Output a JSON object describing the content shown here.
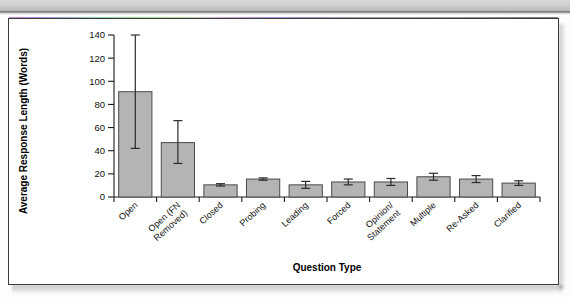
{
  "figure": {
    "panel_background": "#ffffff",
    "panel_border_color": "#3a3a3a",
    "bar_fill_color": "#b4b4b4",
    "bar_edge_color": "#4a4a4a",
    "error_bar_color": "#2b2b2b"
  },
  "chart_data": {
    "type": "bar",
    "title": "",
    "xlabel": "Question Type",
    "ylabel": "Average Response Length (Words)",
    "ylim": [
      0,
      140
    ],
    "yticks": [
      0,
      20,
      40,
      60,
      80,
      100,
      120,
      140
    ],
    "grid": false,
    "legend": null,
    "categories": [
      "Open",
      "Open (FN Removed)",
      "Closed",
      "Probing",
      "Leading",
      "Forced",
      "Opinion/ Statement",
      "Multiple",
      "Re-Asked",
      "Clarified"
    ],
    "category_lines": [
      [
        "Open"
      ],
      [
        "Open (FN",
        "Removed)"
      ],
      [
        "Closed"
      ],
      [
        "Probing"
      ],
      [
        "Leading"
      ],
      [
        "Forced"
      ],
      [
        "Opinion/",
        "Statement"
      ],
      [
        "Multiple"
      ],
      [
        "Re-Asked"
      ],
      [
        "Clarified"
      ]
    ],
    "values": [
      91,
      47,
      10.5,
      15.5,
      10.5,
      13,
      13,
      17.5,
      15.5,
      12
    ],
    "error_low": [
      42,
      29,
      9.5,
      14.5,
      7.5,
      10.5,
      10,
      14.5,
      12.5,
      10
    ],
    "error_high": [
      140,
      66,
      11.5,
      16.5,
      13.5,
      15.5,
      16,
      20.5,
      18.5,
      14
    ]
  }
}
